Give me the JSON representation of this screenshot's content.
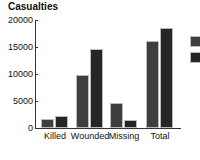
{
  "chart_data": {
    "type": "bar",
    "title": "Casualties",
    "xlabel": "",
    "ylabel": "",
    "categories": [
      "Killed",
      "Wounded",
      "Missing",
      "Total"
    ],
    "series": [
      {
        "name": "Series 1",
        "color": "#3e3e3e",
        "values": [
          1600,
          9800,
          4700,
          16200
        ]
      },
      {
        "name": "Series 2",
        "color": "#262626",
        "values": [
          2300,
          14700,
          1500,
          18500
        ]
      }
    ],
    "ylim": [
      0,
      20000
    ],
    "yticks": [
      "0",
      "5000",
      "10000",
      "15000",
      "20000"
    ],
    "grid": false,
    "legend_position": "right"
  }
}
